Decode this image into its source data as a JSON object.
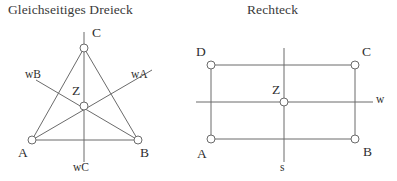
{
  "figures": [
    {
      "id": "equilateral-triangle",
      "title": "Gleichseitiges Dreieck",
      "vertices": [
        {
          "name": "C",
          "label": "C"
        },
        {
          "name": "A",
          "label": "A"
        },
        {
          "name": "B",
          "label": "B"
        },
        {
          "name": "Z",
          "label": "Z"
        }
      ],
      "axes": [
        {
          "name": "wA",
          "label": "wA"
        },
        {
          "name": "wB",
          "label": "wB"
        },
        {
          "name": "wC",
          "label": "wC"
        }
      ]
    },
    {
      "id": "rectangle",
      "title": "Rechteck",
      "vertices": [
        {
          "name": "D",
          "label": "D"
        },
        {
          "name": "C",
          "label": "C"
        },
        {
          "name": "A",
          "label": "A"
        },
        {
          "name": "B",
          "label": "B"
        },
        {
          "name": "Z",
          "label": "Z"
        }
      ],
      "axes": [
        {
          "name": "w",
          "label": "w"
        },
        {
          "name": "s",
          "label": "s"
        }
      ]
    }
  ],
  "colors": {
    "stroke": "#6b6b6b",
    "marker_fill": "#ffffff",
    "text": "#2f2f2f",
    "background": "#ffffff"
  }
}
